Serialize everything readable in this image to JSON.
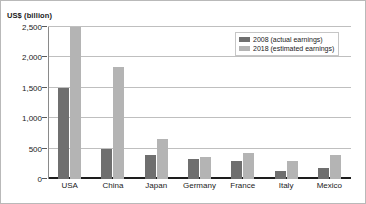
{
  "chart_data": {
    "type": "bar",
    "title": "",
    "xlabel": "",
    "ylabel": "US$ (billion)",
    "categories": [
      "USA",
      "China",
      "Japan",
      "Germany",
      "France",
      "Italy",
      "Mexico"
    ],
    "series": [
      {
        "name": "2008 (actual earnings)",
        "color": "#6f6f6f",
        "values": [
          1500,
          500,
          400,
          330,
          300,
          130,
          180
        ]
      },
      {
        "name": "2018 (estimated earnings)",
        "color": "#b4b4b4",
        "values": [
          2500,
          1850,
          650,
          370,
          420,
          290,
          400
        ]
      }
    ],
    "ylim": [
      0,
      2500
    ],
    "yticks": [
      0,
      500,
      1000,
      1500,
      2000,
      2500
    ],
    "ytick_labels": [
      "0",
      "500",
      "1,000",
      "1,500",
      "2,000",
      "2,500"
    ],
    "grid": true,
    "legend_position": "top-right"
  },
  "legend": {
    "entries": [
      "2008 (actual earnings)",
      "2018 (estimated earnings)"
    ]
  },
  "colors": {
    "series_0": "#6f6f6f",
    "series_1": "#b4b4b4",
    "gridline": "#bfbfbf",
    "axis": "#1d1d1d",
    "text": "#1a1a1a",
    "background": "#ffffff"
  }
}
